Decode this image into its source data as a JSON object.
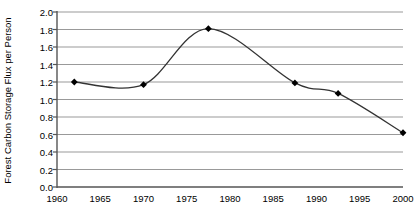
{
  "chart_data": {
    "type": "line",
    "title": "",
    "xlabel": "",
    "ylabel": "Forest Carbon Storage Flux per Person",
    "xlim": [
      1960,
      2000
    ],
    "ylim": [
      0.0,
      2.0
    ],
    "grid": true,
    "legend": "none",
    "marker": "filled-diamond",
    "line_color": "#333333",
    "grid_color": "#999999",
    "axis_color": "#555555",
    "x_ticks": [
      "1960",
      "1965",
      "1970",
      "1975",
      "1980",
      "1985",
      "1990",
      "1995",
      "2000"
    ],
    "y_ticks": [
      "0.0",
      "0.2",
      "0.4",
      "0.6",
      "0.8",
      "1.0",
      "1.2",
      "1.4",
      "1.6",
      "1.8",
      "2.0"
    ],
    "x": [
      1962,
      1970,
      1977.5,
      1987.5,
      1992.5,
      2000
    ],
    "values": [
      1.2,
      1.17,
      1.81,
      1.19,
      1.07,
      0.62
    ],
    "points": [
      {
        "x": 1962,
        "y": 1.2
      },
      {
        "x": 1970,
        "y": 1.17
      },
      {
        "x": 1977.5,
        "y": 1.81
      },
      {
        "x": 1987.5,
        "y": 1.19
      },
      {
        "x": 1992.5,
        "y": 1.07
      },
      {
        "x": 2000,
        "y": 0.62
      }
    ]
  },
  "axis": {
    "y_label": "Forest Carbon Storage Flux per Person"
  }
}
